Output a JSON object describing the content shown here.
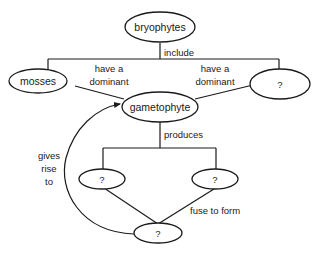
{
  "diagram": {
    "nodes": {
      "bryophytes": "bryophytes",
      "mosses": "mosses",
      "unknown_group": "?",
      "gametophyte": "gametophyte",
      "unknown_gamete_left": "?",
      "unknown_gamete_right": "?",
      "unknown_product": "?"
    },
    "edges": {
      "include": "include",
      "have_dominant_left_1": "have a",
      "have_dominant_left_2": "dominant",
      "have_dominant_right_1": "have a",
      "have_dominant_right_2": "dominant",
      "produces": "produces",
      "fuse_to_form": "fuse to form",
      "gives_rise_to_1": "gives",
      "gives_rise_to_2": "rise",
      "gives_rise_to_3": "to"
    }
  }
}
